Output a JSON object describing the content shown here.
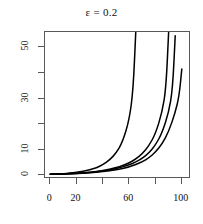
{
  "chart_data": {
    "type": "line",
    "title": "ε = 0.2",
    "xlabel": "",
    "ylabel": "",
    "grid": false,
    "legend": "none",
    "xlim": [
      -4,
      107
    ],
    "ylim": [
      -1.5,
      56
    ],
    "xticks": [
      0,
      20,
      40,
      60,
      80,
      100
    ],
    "xticklabels": [
      "0",
      "20",
      "",
      "60",
      "",
      "100"
    ],
    "yticks": [
      0,
      10,
      20,
      30,
      40,
      50
    ],
    "yticklabels": [
      "0",
      "10",
      "",
      "30",
      "",
      "50"
    ],
    "series": [
      {
        "name": "curve-1",
        "color": "#000000",
        "x": [
          0,
          5,
          10,
          15,
          20,
          25,
          30,
          35,
          40,
          45,
          50,
          55,
          60,
          63,
          65
        ],
        "y": [
          0.35,
          0.45,
          0.6,
          0.8,
          1.1,
          1.5,
          2.1,
          2.9,
          4.1,
          5.9,
          8.6,
          13.0,
          21.5,
          33.0,
          56.0
        ]
      },
      {
        "name": "curve-2",
        "color": "#000000",
        "x": [
          0,
          10,
          20,
          30,
          40,
          50,
          55,
          60,
          65,
          70,
          75,
          80,
          85,
          88,
          90
        ],
        "y": [
          0.35,
          0.5,
          0.75,
          1.15,
          1.8,
          2.9,
          3.7,
          4.8,
          6.3,
          8.4,
          11.5,
          16.2,
          24.5,
          34.0,
          56.0
        ]
      },
      {
        "name": "curve-3",
        "color": "#000000",
        "x": [
          0,
          10,
          20,
          30,
          40,
          50,
          60,
          65,
          70,
          75,
          80,
          85,
          90,
          93,
          95
        ],
        "y": [
          0.35,
          0.48,
          0.7,
          1.05,
          1.6,
          2.5,
          4.0,
          5.1,
          6.6,
          8.7,
          11.8,
          16.5,
          24.5,
          33.5,
          54.5
        ]
      },
      {
        "name": "curve-4",
        "color": "#000000",
        "x": [
          0,
          10,
          20,
          30,
          40,
          50,
          60,
          70,
          75,
          80,
          85,
          90,
          95,
          98,
          100
        ],
        "y": [
          0.35,
          0.45,
          0.62,
          0.9,
          1.35,
          2.05,
          3.2,
          5.2,
          6.8,
          9.0,
          12.2,
          17.0,
          24.5,
          31.0,
          41.5
        ]
      }
    ]
  }
}
